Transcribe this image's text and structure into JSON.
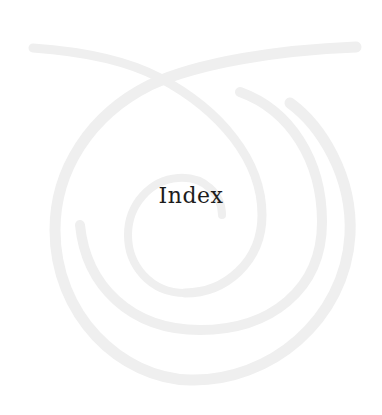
{
  "page": {
    "title": "Index",
    "decoration": "spiral-ornament",
    "colors": {
      "background": "#ffffff",
      "ornament": "#efefef",
      "title_text": "#1c1c1c"
    }
  }
}
